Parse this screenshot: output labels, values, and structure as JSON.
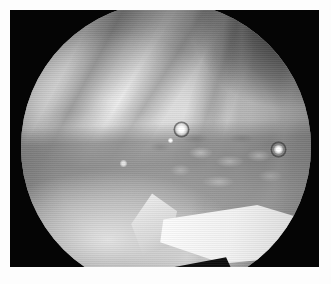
{
  "image": {
    "title": "Arthroscopic Endoscope View",
    "modality": "arthroscopy",
    "color_mode": "grayscale",
    "caption": "",
    "dimensions": {
      "width": 331,
      "height": 284
    }
  },
  "frame": {
    "name": "endoscope-letterbox",
    "background_color": "#050505",
    "matte_color": "#fdfdfd",
    "matte_border_px": 10
  },
  "field_of_view": {
    "shape": "circle",
    "clipped_edges": "top-and-bottom",
    "center_x": 166,
    "center_y": 137,
    "diameter": 290,
    "base_color": "#9a9a9a"
  },
  "regions": [
    {
      "name": "upper-soft-tissue-mass",
      "label": "Upper bright soft-tissue / cartilage mass",
      "tone": "bright",
      "approx_gray": "#ededed"
    },
    {
      "name": "upper-right-shadow",
      "label": "Dark recess at upper-right rim",
      "tone": "dark",
      "approx_gray": "#2a2a2a"
    },
    {
      "name": "diagonal-shadow-bands",
      "label": "Diagonal shadow bands across superior field",
      "tone": "mid-dark",
      "approx_gray": "#5a5a5a"
    },
    {
      "name": "mid-fibrocartilage-band",
      "label": "Mid horizontal fibro-cartilage band with villous texture",
      "tone": "mid",
      "approx_gray": "#7e7e7e"
    },
    {
      "name": "lower-bone-mass",
      "label": "Lower pale bone / cartilage surface",
      "tone": "bright",
      "approx_gray": "#e2e2e2"
    },
    {
      "name": "instrument-wedge",
      "label": "Bright wedge-shaped instrument / probe, lower right",
      "tone": "very-bright",
      "approx_gray": "#fdfdfd"
    },
    {
      "name": "inferior-notch",
      "label": "Dark notch below the instrument",
      "tone": "very-dark",
      "approx_gray": "#0d0d0d"
    }
  ],
  "specular_highlights": [
    {
      "name": "highlight-center",
      "x": 190,
      "y": 122,
      "radius": 5,
      "intensity": "high"
    },
    {
      "name": "highlight-right",
      "x": 288,
      "y": 143,
      "radius": 4,
      "intensity": "high"
    },
    {
      "name": "highlight-left",
      "x": 133,
      "y": 158,
      "radius": 3,
      "intensity": "medium"
    },
    {
      "name": "highlight-center-small",
      "x": 181,
      "y": 134,
      "radius": 2,
      "intensity": "low"
    }
  ]
}
